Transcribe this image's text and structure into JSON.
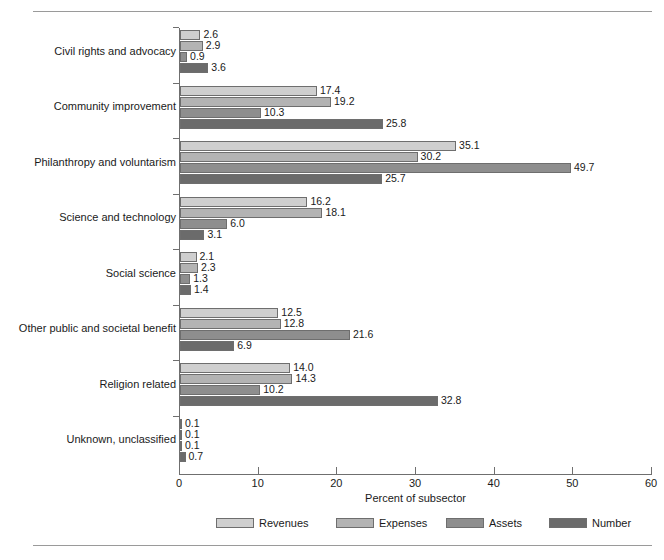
{
  "figure": {
    "header_sliver": "",
    "xaxis_title": "Percent of subsector"
  },
  "legend": {
    "items": [
      {
        "label": "Revenues",
        "color": "#cfcfcf"
      },
      {
        "label": "Expenses",
        "color": "#b3b3b3"
      },
      {
        "label": "Assets",
        "color": "#8e8e8e"
      },
      {
        "label": "Number",
        "color": "#6b6b6b"
      }
    ]
  },
  "chart_data": {
    "type": "bar",
    "orientation": "horizontal",
    "title": "",
    "xlabel": "Percent of subsector",
    "ylabel": "",
    "xlim": [
      0,
      60
    ],
    "xticks": [
      0,
      10,
      20,
      30,
      40,
      50,
      60
    ],
    "xtick_labels": [
      "0",
      "10",
      "20",
      "30",
      "40",
      "50",
      "60"
    ],
    "grid": false,
    "legend_position": "bottom",
    "categories": [
      "Civil rights and advocacy",
      "Community improvement",
      "Philanthropy and voluntarism",
      "Science and technology",
      "Social science",
      "Other public and societal benefit",
      "Religion related",
      "Unknown, unclassified"
    ],
    "series": [
      {
        "name": "Revenues",
        "color": "#cfcfcf",
        "values": [
          2.6,
          17.4,
          35.1,
          16.2,
          2.1,
          12.5,
          14.0,
          0.1
        ],
        "labels": [
          "2.6",
          "17.4",
          "35.1",
          "16.2",
          "2.1",
          "12.5",
          "14.0",
          "0.1"
        ]
      },
      {
        "name": "Expenses",
        "color": "#b3b3b3",
        "values": [
          2.9,
          19.2,
          30.2,
          18.1,
          2.3,
          12.8,
          14.3,
          0.1
        ],
        "labels": [
          "2.9",
          "19.2",
          "30.2",
          "18.1",
          "2.3",
          "12.8",
          "14.3",
          "0.1"
        ]
      },
      {
        "name": "Assets",
        "color": "#8e8e8e",
        "values": [
          0.9,
          10.3,
          49.7,
          6.0,
          1.3,
          21.6,
          10.2,
          0.1
        ],
        "labels": [
          "0.9",
          "10.3",
          "49.7",
          "6.0",
          "1.3",
          "21.6",
          "10.2",
          "0.1"
        ]
      },
      {
        "name": "Number",
        "color": "#6b6b6b",
        "values": [
          3.6,
          25.8,
          25.7,
          3.1,
          1.4,
          6.9,
          32.8,
          0.7
        ],
        "labels": [
          "3.6",
          "25.8",
          "25.7",
          "3.1",
          "1.4",
          "6.9",
          "32.8",
          "0.7"
        ]
      }
    ]
  }
}
